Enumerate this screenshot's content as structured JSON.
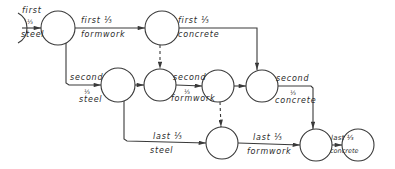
{
  "diagram": {
    "type": "activity-on-arrow network",
    "colors": {
      "line": "#3a3a3a",
      "background": "#ffffff"
    },
    "nodes": [
      {
        "id": "n0",
        "x": 8,
        "y": 28,
        "partial": true
      },
      {
        "id": "n1",
        "x": 58,
        "y": 28
      },
      {
        "id": "n2",
        "x": 162,
        "y": 28
      },
      {
        "id": "n3",
        "x": 118,
        "y": 85
      },
      {
        "id": "n4",
        "x": 160,
        "y": 85
      },
      {
        "id": "n5",
        "x": 218,
        "y": 86
      },
      {
        "id": "n6",
        "x": 262,
        "y": 86
      },
      {
        "id": "n7",
        "x": 222,
        "y": 143
      },
      {
        "id": "n8",
        "x": 316,
        "y": 145
      },
      {
        "id": "n9",
        "x": 358,
        "y": 145
      }
    ],
    "activities": [
      {
        "id": "a1",
        "line1": "first",
        "line2": "⅓",
        "line3": "steel"
      },
      {
        "id": "a2",
        "line1": "first ⅓",
        "line2": "formwork"
      },
      {
        "id": "a3",
        "line1": "first ⅓",
        "line2": "concrete"
      },
      {
        "id": "a4",
        "line1": "second",
        "line2": "⅓",
        "line3": "steel"
      },
      {
        "id": "a5",
        "line1": "second",
        "line2": "⅓",
        "line3": "formwork"
      },
      {
        "id": "a6",
        "line1": "second",
        "line2": "⅓",
        "line3": "concrete"
      },
      {
        "id": "a7",
        "line1": "last ⅓",
        "line2": "steel"
      },
      {
        "id": "a8",
        "line1": "last ⅓",
        "line2": "formwork"
      },
      {
        "id": "a9",
        "line1": "last ⅓",
        "line2": "concrete"
      }
    ]
  }
}
